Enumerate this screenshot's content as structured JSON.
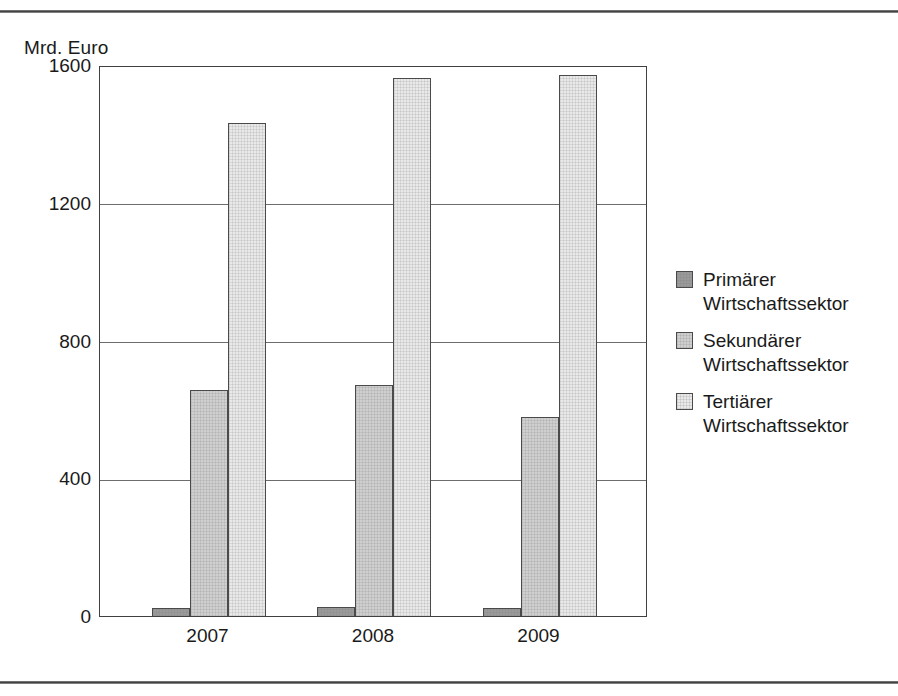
{
  "figure": {
    "unit_label": "Mrd. Euro"
  },
  "chart_data": {
    "type": "bar",
    "title": "",
    "subtitle": "",
    "xlabel": "",
    "ylabel": "Mrd. Euro",
    "categories": [
      "2007",
      "2008",
      "2009"
    ],
    "series": [
      {
        "name": "Primärer\nWirtschaftssektor",
        "color": "#9a9a9a",
        "values": [
          23,
          25,
          23
        ]
      },
      {
        "name": "Sekundärer\nWirtschaftssektor",
        "color": "#cfcfcf",
        "values": [
          655,
          670,
          577
        ]
      },
      {
        "name": "Tertiärer\nWirtschaftssektor",
        "color": "#e9e9e9",
        "values": [
          1432,
          1562,
          1570
        ]
      }
    ],
    "ylim": [
      0,
      1600
    ],
    "yticks": [
      0,
      400,
      800,
      1200,
      1600
    ],
    "ytick_labels": [
      "0",
      "400",
      "800",
      "1200",
      "1600"
    ],
    "grid": true,
    "grid_axis": "y",
    "legend_position": "right"
  },
  "legend": {
    "items": [
      {
        "label": "Primärer\nWirtschaftssektor",
        "color": "#9a9a9a"
      },
      {
        "label": "Sekundärer\nWirtschaftssektor",
        "color": "#cfcfcf"
      },
      {
        "label": "Tertiärer\nWirtschaftssektor",
        "color": "#e9e9e9"
      }
    ]
  }
}
